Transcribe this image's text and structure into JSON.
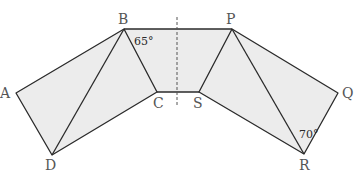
{
  "diagram": {
    "type": "geometry",
    "vertices": {
      "A": {
        "label": "A",
        "x": 16,
        "y": 93
      },
      "B": {
        "label": "B",
        "x": 124,
        "y": 29
      },
      "C": {
        "label": "C",
        "x": 157,
        "y": 92
      },
      "D": {
        "label": "D",
        "x": 52,
        "y": 155
      },
      "P": {
        "label": "P",
        "x": 232,
        "y": 29
      },
      "Q": {
        "label": "Q",
        "x": 338,
        "y": 93
      },
      "R": {
        "label": "R",
        "x": 304,
        "y": 154
      },
      "S": {
        "label": "S",
        "x": 199,
        "y": 92
      }
    },
    "angles": [
      {
        "at": "B",
        "label": "65°"
      },
      {
        "at": "R",
        "label": "70°"
      }
    ],
    "symmetry_line": {
      "x": 177,
      "y1": 17,
      "y2": 105,
      "style": "dashed"
    },
    "colors": {
      "fill": "#ececec",
      "stroke": "#2a2a2a",
      "label": "#555555"
    }
  }
}
